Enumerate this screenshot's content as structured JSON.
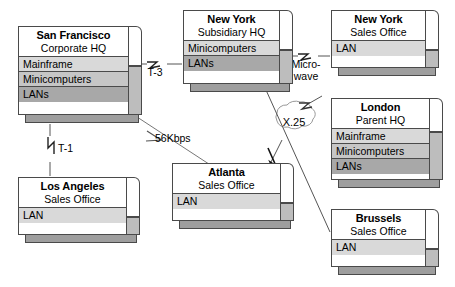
{
  "diagram": {
    "colors": {
      "box_fill": "#ffffff",
      "row_light": "#d9d9d9",
      "row_mid": "#c6c6c6",
      "row_dark": "#a8a8a8",
      "side_shade": "#bdbdbd",
      "bottom_shade": "#9e9e9e",
      "outline": "#4a4a4a",
      "link": "#555555"
    }
  },
  "nodes": [
    {
      "id": "san-francisco",
      "city": "San Francisco",
      "role": "Corporate HQ",
      "rows": [
        "Mainframe",
        "Minicomputers",
        "LANs"
      ]
    },
    {
      "id": "new-york-subsidiary",
      "city": "New York",
      "role": "Subsidiary HQ",
      "rows": [
        "Minicomputers",
        "LANs"
      ]
    },
    {
      "id": "new-york-sales",
      "city": "New York",
      "role": "Sales Office",
      "rows": [
        "LAN"
      ]
    },
    {
      "id": "london",
      "city": "London",
      "role": "Parent HQ",
      "rows": [
        "Mainframe",
        "Minicomputers",
        "LANs"
      ]
    },
    {
      "id": "brussels",
      "city": "Brussels",
      "role": "Sales Office",
      "rows": [
        "LAN"
      ]
    },
    {
      "id": "atlanta",
      "city": "Atlanta",
      "role": "Sales Office",
      "rows": [
        "LAN"
      ]
    },
    {
      "id": "los-angeles",
      "city": "Los Angeles",
      "role": "Sales Office",
      "rows": [
        "LAN"
      ]
    }
  ],
  "links": [
    {
      "id": "sf-ny",
      "label": "T-3",
      "from": "san-francisco",
      "to": "new-york-subsidiary"
    },
    {
      "id": "ny-nysales",
      "label_line1": "Micro-",
      "label_line2": "wave",
      "from": "new-york-subsidiary",
      "to": "new-york-sales"
    },
    {
      "id": "sf-atlanta",
      "label": "56Kbps",
      "from": "san-francisco",
      "to": "atlanta"
    },
    {
      "id": "sf-la",
      "label": "T-1",
      "from": "san-francisco",
      "to": "los-angeles"
    },
    {
      "id": "atlanta-london",
      "label": "X.25",
      "from": "atlanta",
      "to": "london"
    },
    {
      "id": "ny-brussels",
      "label": "",
      "from": "new-york-subsidiary",
      "to": "brussels"
    }
  ]
}
